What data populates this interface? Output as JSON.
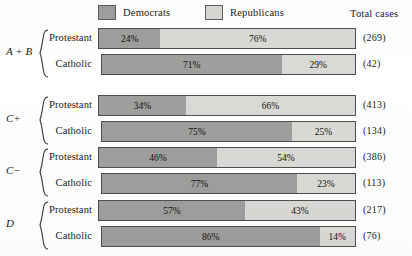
{
  "legend": {
    "democrats_label": "Democrats",
    "republicans_label": "Republicans",
    "total_cases_label": "Total cases",
    "democrats_color": "#9e9e9c",
    "republicans_color": "#d8d8d4"
  },
  "chart_data": {
    "type": "bar",
    "subtype": "horizontal-stacked-100pct",
    "title": "",
    "xlabel": "",
    "ylabel": "",
    "xlim": [
      0,
      100
    ],
    "grid": false,
    "legend_position": "top",
    "series": [
      {
        "name": "Democrats",
        "color": "#9e9e9c",
        "values": [
          24,
          71,
          34,
          75,
          46,
          77,
          57,
          86
        ]
      },
      {
        "name": "Republicans",
        "color": "#d8d8d4",
        "values": [
          76,
          29,
          66,
          25,
          54,
          23,
          43,
          14
        ]
      }
    ],
    "categories": [
      "A + B Protestant",
      "A + B Catholic",
      "C+ Protestant",
      "C+ Catholic",
      "C- Protestant",
      "C- Catholic",
      "D Protestant",
      "D Catholic"
    ],
    "totals": [
      269,
      42,
      413,
      134,
      386,
      113,
      217,
      76
    ],
    "groups": [
      {
        "label": "A + B",
        "rows": [
          {
            "label": "Protestant",
            "democrats": "24%",
            "republicans": "76%",
            "dem_pct": 24,
            "rep_pct": 76,
            "total": "(269)"
          },
          {
            "label": "Catholic",
            "democrats": "71%",
            "republicans": "29%",
            "dem_pct": 71,
            "rep_pct": 29,
            "total": "(42)"
          }
        ]
      },
      {
        "label": "C+",
        "rows": [
          {
            "label": "Protestant",
            "democrats": "34%",
            "republicans": "66%",
            "dem_pct": 34,
            "rep_pct": 66,
            "total": "(413)"
          },
          {
            "label": "Catholic",
            "democrats": "75%",
            "republicans": "25%",
            "dem_pct": 75,
            "rep_pct": 25,
            "total": "(134)"
          }
        ]
      },
      {
        "label": "C−",
        "rows": [
          {
            "label": "Protestant",
            "democrats": "46%",
            "republicans": "54%",
            "dem_pct": 46,
            "rep_pct": 54,
            "total": "(386)"
          },
          {
            "label": "Catholic",
            "democrats": "77%",
            "republicans": "23%",
            "dem_pct": 77,
            "rep_pct": 23,
            "total": "(113)"
          }
        ]
      },
      {
        "label": "D",
        "rows": [
          {
            "label": "Protestant",
            "democrats": "57%",
            "republicans": "43%",
            "dem_pct": 57,
            "rep_pct": 43,
            "total": "(217)"
          },
          {
            "label": "Catholic",
            "democrats": "86%",
            "republicans": "14%",
            "dem_pct": 86,
            "rep_pct": 14,
            "total": "(76)"
          }
        ]
      }
    ]
  }
}
